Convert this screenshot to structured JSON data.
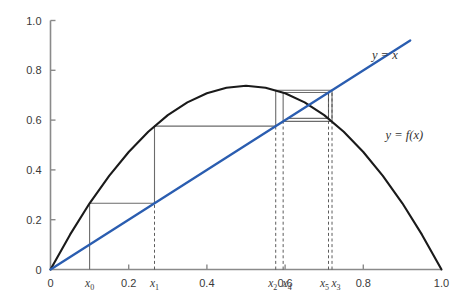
{
  "chart_data": {
    "type": "line",
    "title": "",
    "subtitle": "",
    "xlabel": "",
    "ylabel": "",
    "xlim": [
      0,
      1.0
    ],
    "ylim": [
      0,
      1.0
    ],
    "grid": false,
    "legend_position": "inline-annotations",
    "x_ticks": [
      {
        "value": 0,
        "label": "0"
      },
      {
        "value": 0.2,
        "label": "0.2"
      },
      {
        "value": 0.4,
        "label": "0.4"
      },
      {
        "value": 0.6,
        "label": "0.6"
      },
      {
        "value": 0.8,
        "label": "0.8"
      },
      {
        "value": 1.0,
        "label": "1.0"
      }
    ],
    "y_ticks": [
      {
        "value": 0,
        "label": "0"
      },
      {
        "value": 0.2,
        "label": "0.2"
      },
      {
        "value": 0.4,
        "label": "0.4"
      },
      {
        "value": 0.6,
        "label": "0.6"
      },
      {
        "value": 0.8,
        "label": "0.8"
      },
      {
        "value": 1.0,
        "label": "1.0"
      }
    ],
    "series": [
      {
        "name": "y = f(x)",
        "label": "y = f(x)",
        "type": "curve",
        "color": "#1a1a1a",
        "function": "logistic",
        "r": 2.95,
        "peak": {
          "x": 0.5,
          "y": 0.7375
        },
        "points": [
          {
            "x": 0.0,
            "y": 0.0
          },
          {
            "x": 0.05,
            "y": 0.14
          },
          {
            "x": 0.1,
            "y": 0.266
          },
          {
            "x": 0.15,
            "y": 0.376
          },
          {
            "x": 0.2,
            "y": 0.472
          },
          {
            "x": 0.25,
            "y": 0.553
          },
          {
            "x": 0.3,
            "y": 0.62
          },
          {
            "x": 0.35,
            "y": 0.671
          },
          {
            "x": 0.4,
            "y": 0.708
          },
          {
            "x": 0.45,
            "y": 0.73
          },
          {
            "x": 0.5,
            "y": 0.738
          },
          {
            "x": 0.55,
            "y": 0.73
          },
          {
            "x": 0.6,
            "y": 0.708
          },
          {
            "x": 0.65,
            "y": 0.671
          },
          {
            "x": 0.7,
            "y": 0.62
          },
          {
            "x": 0.75,
            "y": 0.553
          },
          {
            "x": 0.8,
            "y": 0.472
          },
          {
            "x": 0.85,
            "y": 0.376
          },
          {
            "x": 0.9,
            "y": 0.266
          },
          {
            "x": 0.95,
            "y": 0.14
          },
          {
            "x": 1.0,
            "y": 0.0
          }
        ]
      },
      {
        "name": "y = x",
        "label": "y = x",
        "type": "line",
        "color": "#2a5db0",
        "points": [
          {
            "x": 0.0,
            "y": 0.0
          },
          {
            "x": 0.92,
            "y": 0.92
          }
        ]
      }
    ],
    "cobweb": {
      "color": "#6b6b6b",
      "start_x": 0.1,
      "iterates": [
        {
          "name": "x_0",
          "label": "x",
          "subscript": "0",
          "x": 0.1,
          "fx": 0.266
        },
        {
          "name": "x_1",
          "label": "x",
          "subscript": "1",
          "x": 0.266,
          "fx": 0.576
        },
        {
          "name": "x_2",
          "label": "x",
          "subscript": "2",
          "x": 0.576,
          "fx": 0.72
        },
        {
          "name": "x_3",
          "label": "x",
          "subscript": "3",
          "x": 0.72,
          "fx": 0.595
        },
        {
          "name": "x_4",
          "label": "x",
          "subscript": "4",
          "x": 0.595,
          "fx": 0.711
        },
        {
          "name": "x_5",
          "label": "x",
          "subscript": "5",
          "x": 0.711,
          "fx": 0.607
        }
      ],
      "fixed_point": 0.661
    },
    "annotations": [
      {
        "name": "line-label",
        "text": "y = x",
        "x": 0.855,
        "y": 0.845
      },
      {
        "name": "curve-label",
        "text": "y = f(x)",
        "x": 0.905,
        "y": 0.525
      }
    ]
  },
  "axes": {
    "x_axis_color": "#8a8a8a",
    "y_axis_color": "#8a8a8a",
    "tick_color": "#8a8a8a"
  }
}
